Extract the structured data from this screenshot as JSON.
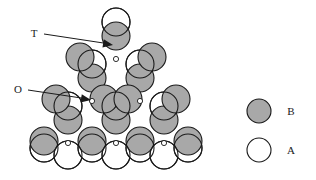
{
  "figure": {
    "background_color": "#ffffff",
    "outline_color": "#1a1a1a",
    "b_fill_color": "#a8a8a8",
    "a_fill_color": "#ffffff",
    "vertex_dot_color": "#ffffff",
    "circle_radius": 14,
    "stroke_width": 1.1
  },
  "annotations": [
    {
      "id": "T",
      "label": "T",
      "label_x": 34,
      "label_y": 37,
      "line_x1": 44,
      "line_y1": 34,
      "line_x2": 110,
      "line_y2": 44,
      "arrow_x": 113,
      "arrow_y": 45,
      "meaning": "tetrahedral-site"
    },
    {
      "id": "O",
      "label": "O",
      "label_x": 18,
      "label_y": 93,
      "line_x1": 28,
      "line_y1": 90,
      "line_x2": 88,
      "line_y2": 99,
      "arrow_x": 91,
      "arrow_y": 100,
      "meaning": "octahedral-site"
    }
  ],
  "legend": {
    "items": [
      {
        "label": "B",
        "fill": "#a8a8a8",
        "cx": 259,
        "cy": 111,
        "r": 12,
        "text_x": 291,
        "text_y": 115
      },
      {
        "label": "A",
        "fill": "#ffffff",
        "cx": 259,
        "cy": 150,
        "r": 12,
        "text_x": 291,
        "text_y": 154
      }
    ]
  },
  "chart_data": {
    "type": "scatter",
    "xlabel": "",
    "ylabel": "",
    "legend_entries": [
      "B",
      "A"
    ],
    "b_circles": [
      {
        "cx": 116,
        "cy": 36
      },
      {
        "cx": 92,
        "cy": 78
      },
      {
        "cx": 140,
        "cy": 78
      },
      {
        "cx": 68,
        "cy": 120
      },
      {
        "cx": 116,
        "cy": 120
      },
      {
        "cx": 164,
        "cy": 120
      },
      {
        "cx": 80,
        "cy": 57
      },
      {
        "cx": 152,
        "cy": 57
      },
      {
        "cx": 56,
        "cy": 99
      },
      {
        "cx": 104,
        "cy": 99
      },
      {
        "cx": 128,
        "cy": 99
      },
      {
        "cx": 176,
        "cy": 99
      },
      {
        "cx": 44,
        "cy": 141
      },
      {
        "cx": 92,
        "cy": 141
      },
      {
        "cx": 140,
        "cy": 141
      },
      {
        "cx": 188,
        "cy": 141
      }
    ],
    "a_circles": [
      {
        "cx": 116,
        "cy": 22
      },
      {
        "cx": 92,
        "cy": 64
      },
      {
        "cx": 140,
        "cy": 64
      },
      {
        "cx": 68,
        "cy": 106
      },
      {
        "cx": 116,
        "cy": 106
      },
      {
        "cx": 164,
        "cy": 106
      },
      {
        "cx": 44,
        "cy": 148
      },
      {
        "cx": 68,
        "cy": 155
      },
      {
        "cx": 92,
        "cy": 148
      },
      {
        "cx": 116,
        "cy": 155
      },
      {
        "cx": 140,
        "cy": 148
      },
      {
        "cx": 164,
        "cy": 155
      },
      {
        "cx": 188,
        "cy": 148
      }
    ],
    "vertex_dots": [
      {
        "cx": 116,
        "cy": 59
      },
      {
        "cx": 92,
        "cy": 101
      },
      {
        "cx": 140,
        "cy": 101
      },
      {
        "cx": 68,
        "cy": 143
      },
      {
        "cx": 116,
        "cy": 143
      },
      {
        "cx": 164,
        "cy": 143
      }
    ]
  }
}
